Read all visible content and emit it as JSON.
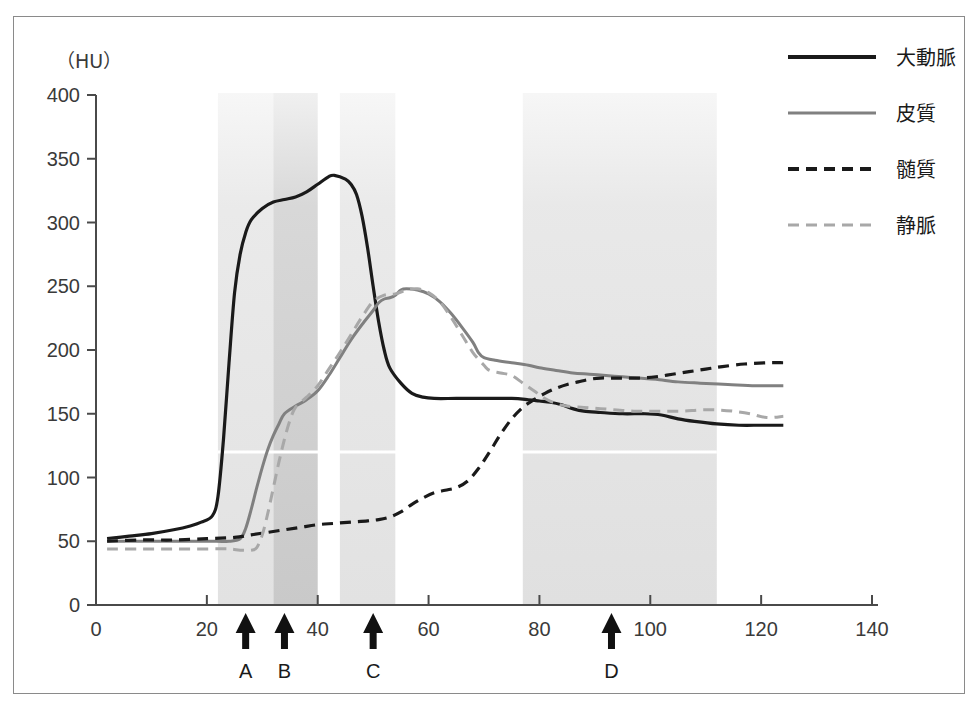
{
  "figure": {
    "unit_label": "（HU）",
    "background": "#ffffff",
    "frame_color": "#8a8a8a"
  },
  "chart_data": {
    "type": "line",
    "title": "",
    "xlabel": "",
    "ylabel": "(HU)",
    "xlim": [
      0,
      140
    ],
    "ylim": [
      0,
      400
    ],
    "grid": false,
    "legend_position": "top-right",
    "x_ticks": [
      0,
      20,
      40,
      60,
      80,
      100,
      120,
      140
    ],
    "y_ticks": [
      0,
      50,
      100,
      150,
      200,
      250,
      300,
      350,
      400
    ],
    "series": [
      {
        "name": "大動脈",
        "style": "solid",
        "color": "#1a1a1a",
        "width": 3.2,
        "points": [
          [
            2,
            52
          ],
          [
            6,
            54
          ],
          [
            10,
            56
          ],
          [
            14,
            59
          ],
          [
            17,
            62
          ],
          [
            19,
            65
          ],
          [
            21,
            70
          ],
          [
            22,
            85
          ],
          [
            23,
            130
          ],
          [
            24,
            190
          ],
          [
            25,
            245
          ],
          [
            26,
            275
          ],
          [
            27,
            292
          ],
          [
            28,
            302
          ],
          [
            30,
            311
          ],
          [
            32,
            316
          ],
          [
            34,
            318
          ],
          [
            36,
            320
          ],
          [
            38,
            324
          ],
          [
            40,
            330
          ],
          [
            42,
            336
          ],
          [
            43,
            337
          ],
          [
            45,
            334
          ],
          [
            46,
            330
          ],
          [
            47,
            322
          ],
          [
            48,
            305
          ],
          [
            49,
            280
          ],
          [
            50,
            250
          ],
          [
            51,
            222
          ],
          [
            52,
            200
          ],
          [
            53,
            186
          ],
          [
            55,
            174
          ],
          [
            57,
            166
          ],
          [
            59,
            163
          ],
          [
            61,
            162
          ],
          [
            65,
            162
          ],
          [
            70,
            162
          ],
          [
            75,
            162
          ],
          [
            78,
            161
          ],
          [
            80,
            160
          ],
          [
            82,
            159
          ],
          [
            84,
            157
          ],
          [
            86,
            154
          ],
          [
            88,
            152
          ],
          [
            91,
            151
          ],
          [
            95,
            150
          ],
          [
            99,
            150
          ],
          [
            102,
            149
          ],
          [
            105,
            146
          ],
          [
            108,
            144
          ],
          [
            112,
            142
          ],
          [
            116,
            141
          ],
          [
            120,
            141
          ],
          [
            124,
            141
          ]
        ]
      },
      {
        "name": "皮質",
        "style": "solid",
        "color": "#808080",
        "width": 3.0,
        "points": [
          [
            2,
            50
          ],
          [
            8,
            50
          ],
          [
            14,
            50
          ],
          [
            20,
            50
          ],
          [
            24,
            50
          ],
          [
            26,
            52
          ],
          [
            27,
            60
          ],
          [
            28,
            75
          ],
          [
            29,
            92
          ],
          [
            30,
            108
          ],
          [
            31,
            122
          ],
          [
            32,
            133
          ],
          [
            33,
            142
          ],
          [
            34,
            150
          ],
          [
            36,
            156
          ],
          [
            38,
            161
          ],
          [
            40,
            168
          ],
          [
            42,
            180
          ],
          [
            44,
            194
          ],
          [
            46,
            208
          ],
          [
            48,
            220
          ],
          [
            50,
            231
          ],
          [
            51,
            237
          ],
          [
            52,
            240
          ],
          [
            53,
            241
          ],
          [
            54,
            243
          ],
          [
            55,
            247
          ],
          [
            56,
            248
          ],
          [
            58,
            247
          ],
          [
            60,
            244
          ],
          [
            62,
            238
          ],
          [
            64,
            229
          ],
          [
            66,
            218
          ],
          [
            68,
            206
          ],
          [
            69,
            198
          ],
          [
            70,
            194
          ],
          [
            72,
            192
          ],
          [
            75,
            190
          ],
          [
            78,
            188
          ],
          [
            80,
            186
          ],
          [
            83,
            184
          ],
          [
            86,
            182
          ],
          [
            89,
            181
          ],
          [
            92,
            180
          ],
          [
            95,
            179
          ],
          [
            98,
            178
          ],
          [
            101,
            177
          ],
          [
            105,
            175
          ],
          [
            109,
            174
          ],
          [
            114,
            173
          ],
          [
            119,
            172
          ],
          [
            124,
            172
          ]
        ]
      },
      {
        "name": "髄質",
        "style": "dashed",
        "color": "#1a1a1a",
        "width": 3.2,
        "points": [
          [
            2,
            50
          ],
          [
            8,
            51
          ],
          [
            14,
            51
          ],
          [
            20,
            52
          ],
          [
            25,
            53
          ],
          [
            28,
            55
          ],
          [
            31,
            57
          ],
          [
            34,
            59
          ],
          [
            37,
            61
          ],
          [
            40,
            63
          ],
          [
            43,
            64
          ],
          [
            46,
            65
          ],
          [
            49,
            66
          ],
          [
            51,
            67
          ],
          [
            53,
            69
          ],
          [
            55,
            73
          ],
          [
            57,
            79
          ],
          [
            59,
            84
          ],
          [
            61,
            88
          ],
          [
            63,
            90
          ],
          [
            65,
            92
          ],
          [
            67,
            97
          ],
          [
            69,
            107
          ],
          [
            71,
            120
          ],
          [
            73,
            134
          ],
          [
            75,
            146
          ],
          [
            77,
            155
          ],
          [
            79,
            161
          ],
          [
            81,
            166
          ],
          [
            83,
            170
          ],
          [
            85,
            173
          ],
          [
            87,
            175
          ],
          [
            89,
            177
          ],
          [
            91,
            178
          ],
          [
            93,
            178
          ],
          [
            95,
            178
          ],
          [
            98,
            178
          ],
          [
            101,
            179
          ],
          [
            104,
            181
          ],
          [
            107,
            183
          ],
          [
            110,
            185
          ],
          [
            113,
            187
          ],
          [
            117,
            189
          ],
          [
            121,
            190
          ],
          [
            124,
            190
          ]
        ]
      },
      {
        "name": "静脈",
        "style": "dashed",
        "color": "#a8a8a8",
        "width": 3.0,
        "points": [
          [
            2,
            44
          ],
          [
            8,
            44
          ],
          [
            14,
            44
          ],
          [
            20,
            44
          ],
          [
            24,
            44
          ],
          [
            26,
            43
          ],
          [
            28,
            43
          ],
          [
            29,
            45
          ],
          [
            30,
            55
          ],
          [
            31,
            72
          ],
          [
            32,
            92
          ],
          [
            33,
            112
          ],
          [
            34,
            130
          ],
          [
            35,
            145
          ],
          [
            36,
            155
          ],
          [
            38,
            163
          ],
          [
            40,
            172
          ],
          [
            42,
            185
          ],
          [
            44,
            198
          ],
          [
            46,
            212
          ],
          [
            48,
            226
          ],
          [
            50,
            238
          ],
          [
            52,
            243
          ],
          [
            54,
            244
          ],
          [
            56,
            247
          ],
          [
            58,
            248
          ],
          [
            60,
            245
          ],
          [
            62,
            238
          ],
          [
            64,
            226
          ],
          [
            66,
            212
          ],
          [
            68,
            198
          ],
          [
            70,
            188
          ],
          [
            71,
            184
          ],
          [
            73,
            182
          ],
          [
            75,
            180
          ],
          [
            77,
            174
          ],
          [
            79,
            168
          ],
          [
            81,
            162
          ],
          [
            83,
            158
          ],
          [
            85,
            156
          ],
          [
            88,
            155
          ],
          [
            91,
            154
          ],
          [
            94,
            153
          ],
          [
            97,
            152
          ],
          [
            100,
            152
          ],
          [
            103,
            152
          ],
          [
            106,
            152
          ],
          [
            109,
            153
          ],
          [
            112,
            153
          ],
          [
            115,
            152
          ],
          [
            118,
            150
          ],
          [
            121,
            147
          ],
          [
            124,
            148
          ]
        ]
      }
    ],
    "bands": [
      {
        "name": "band-1",
        "x0": 22,
        "x1": 32,
        "fill": "#e2e2e2"
      },
      {
        "name": "band-2",
        "x0": 32,
        "x1": 40,
        "fill": "#c9c9c9"
      },
      {
        "name": "band-3",
        "x0": 44,
        "x1": 54,
        "fill": "#e2e2e2"
      },
      {
        "name": "band-4",
        "x0": 77,
        "x1": 112,
        "fill": "#e0e0e0"
      }
    ],
    "markers": [
      {
        "label": "A",
        "x": 27
      },
      {
        "label": "B",
        "x": 34
      },
      {
        "label": "C",
        "x": 50
      },
      {
        "label": "D",
        "x": 93
      }
    ],
    "annotations": [
      {
        "name": "white-rule",
        "y": 120,
        "x0": 22,
        "x1": 112,
        "color": "#ffffff"
      }
    ]
  },
  "legend": {
    "items": [
      {
        "label": "大動脈",
        "style": "solid",
        "color": "#1a1a1a",
        "width": 4
      },
      {
        "label": "皮質",
        "style": "solid",
        "color": "#808080",
        "width": 3
      },
      {
        "label": "髄質",
        "style": "dashed",
        "color": "#1a1a1a",
        "width": 4
      },
      {
        "label": "静脈",
        "style": "dashed",
        "color": "#a8a8a8",
        "width": 3
      }
    ]
  }
}
